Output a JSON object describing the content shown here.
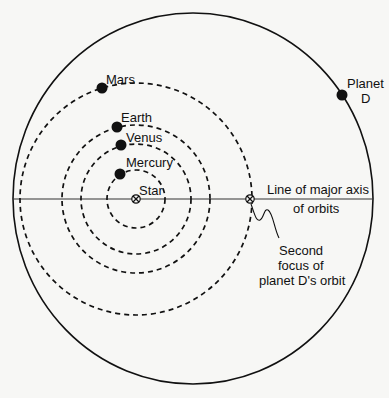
{
  "diagram": {
    "colors": {
      "line": "#111111",
      "background": "#f7f7f5"
    },
    "star": {
      "label": "Star",
      "symbol": "circle-x",
      "x": 136,
      "y": 199
    },
    "second_focus": {
      "symbol": "circle-x",
      "x": 250,
      "y": 199,
      "label_lines": [
        "Second",
        "focus of",
        "planet D's orbit"
      ]
    },
    "major_axis": {
      "label_lines": [
        "Line of major axis",
        "of orbits"
      ]
    },
    "orbits": [
      {
        "name": "Mercury",
        "label": "Mercury",
        "radius": 29
      },
      {
        "name": "Venus",
        "label": "Venus",
        "radius": 55
      },
      {
        "name": "Earth",
        "label": "Earth",
        "radius": 74
      },
      {
        "name": "Mars",
        "label": "Mars",
        "radius": 116
      }
    ],
    "planet_d": {
      "label_lines": [
        "Planet",
        "D"
      ]
    }
  }
}
